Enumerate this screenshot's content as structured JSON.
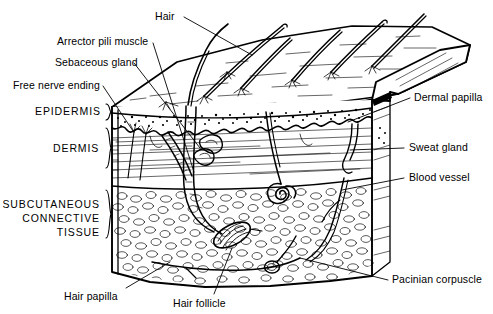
{
  "figure": {
    "style": "black-and-white line drawing",
    "colors": {
      "ink": "#000000",
      "background": "#ffffff"
    }
  },
  "labels": {
    "hair": "Hair",
    "arrector_pili_muscle": "Arrector pili muscle",
    "sebaceous_gland": "Sebaceous gland",
    "free_nerve_ending": "Free nerve ending",
    "epidermis": "EPIDERMIS",
    "dermis": "DERMIS",
    "subcutaneous_line1": "SUBCUTANEOUS",
    "subcutaneous_line2": "CONNECTIVE",
    "subcutaneous_line3": "TISSUE",
    "dermal_papilla": "Dermal papilla",
    "sweat_gland": "Sweat gland",
    "blood_vessel": "Blood vessel",
    "hair_papilla": "Hair papilla",
    "hair_follicle": "Hair follicle",
    "pacinian_corpuscle": "Pacinian corpuscle"
  }
}
